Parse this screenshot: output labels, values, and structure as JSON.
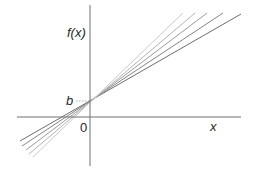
{
  "diagram": {
    "y_axis_label": "f(x)",
    "x_axis_label": "x",
    "intercept_label": "b",
    "origin_label": "0",
    "axes": {
      "origin": [
        90,
        117
      ],
      "x_range_px": [
        17,
        241
      ],
      "y_range_px": [
        5,
        166
      ],
      "color": "#707070"
    },
    "intercept_point": [
      90,
      101
    ],
    "lines": [
      {
        "from": [
          20,
          141
        ],
        "to": [
          241,
          14
        ],
        "color": "#6e6e6e"
      },
      {
        "from": [
          22,
          146
        ],
        "to": [
          223,
          13
        ],
        "color": "#858585"
      },
      {
        "from": [
          26,
          150
        ],
        "to": [
          207,
          13
        ],
        "color": "#9b9b9b"
      },
      {
        "from": [
          29,
          154
        ],
        "to": [
          195,
          13
        ],
        "color": "#b3b3b3"
      },
      {
        "from": [
          33,
          157
        ],
        "to": [
          183,
          13
        ],
        "color": "#cacaca"
      }
    ]
  }
}
